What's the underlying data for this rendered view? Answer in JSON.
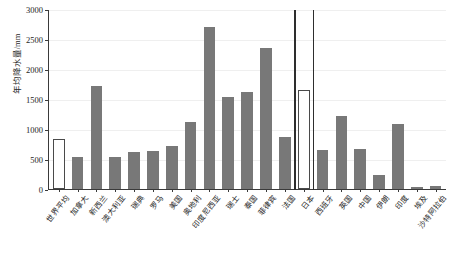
{
  "chart_data": {
    "type": "bar",
    "title": "",
    "xlabel": "",
    "ylabel": "年均降水量/mm",
    "ylim": [
      0,
      3000
    ],
    "yticks": [
      0,
      500,
      1000,
      1500,
      2000,
      2500,
      3000
    ],
    "ytick_labels": [
      "0",
      "500",
      "1000",
      "1500",
      "2000",
      "2500",
      "3000"
    ],
    "grid": true,
    "legend": "none",
    "bar_color": "#787878",
    "highlight_color": "#ffffff",
    "highlight_edge_color": "#4a4a4a",
    "categories": [
      "世界平均",
      "加拿大",
      "新西兰",
      "澳大利亚",
      "瑞典",
      "罗马",
      "美国",
      "奥地利",
      "印度尼西亚",
      "瑞士",
      "泰国",
      "菲律宾",
      "法国",
      "日本",
      "西班牙",
      "英国",
      "中国",
      "伊朗",
      "印度",
      "埃及",
      "沙特阿拉伯"
    ],
    "values": [
      830,
      535,
      1720,
      534,
      620,
      630,
      715,
      1120,
      2700,
      1530,
      1610,
      2340,
      870,
      1650,
      640,
      1220,
      660,
      225,
      1080,
      35,
      45
    ],
    "highlighted": [
      "世界平均",
      "日本"
    ],
    "separators_after": [
      "法国"
    ],
    "separators_before": [
      "日本",
      "西班牙"
    ]
  }
}
